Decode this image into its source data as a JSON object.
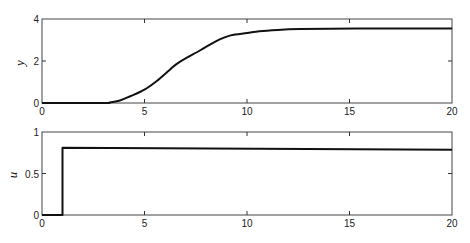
{
  "chart_data": [
    {
      "type": "line",
      "title": "",
      "xlabel": "",
      "ylabel": "y",
      "xlim": [
        0,
        20
      ],
      "ylim": [
        0,
        4
      ],
      "xticks": [
        0,
        5,
        10,
        15,
        20
      ],
      "yticks": [
        0,
        2,
        4
      ],
      "grid": false,
      "legend": null,
      "series": [
        {
          "name": "y",
          "x": [
            0,
            3.0,
            3.3,
            3.8,
            4.3,
            5.0,
            5.6,
            6.25,
            6.7,
            7.7,
            8.5,
            9.2,
            10.0,
            10.6,
            11.5,
            12.6,
            14,
            16,
            18,
            20
          ],
          "y": [
            0,
            0,
            0.02,
            0.12,
            0.32,
            0.64,
            1.05,
            1.6,
            1.95,
            2.5,
            2.95,
            3.22,
            3.33,
            3.42,
            3.48,
            3.52,
            3.54,
            3.55,
            3.55,
            3.55
          ]
        }
      ]
    },
    {
      "type": "line",
      "title": "",
      "xlabel": "",
      "ylabel": "u",
      "xlim": [
        0,
        20
      ],
      "ylim": [
        0,
        1
      ],
      "xticks": [
        0,
        5,
        10,
        15,
        20
      ],
      "yticks": [
        0,
        0.5,
        1
      ],
      "grid": false,
      "legend": null,
      "series": [
        {
          "name": "u",
          "x": [
            0,
            1,
            1,
            20
          ],
          "y": [
            0,
            0,
            0.81,
            0.785
          ]
        }
      ]
    }
  ],
  "labels": {
    "top_ylabel": "y",
    "bottom_ylabel": "u",
    "top_xticks": [
      "0",
      "5",
      "10",
      "15",
      "20"
    ],
    "top_yticks": [
      "0",
      "2",
      "4"
    ],
    "bottom_xticks": [
      "0",
      "5",
      "10",
      "15",
      "20"
    ],
    "bottom_yticks": [
      "0",
      "0.5",
      "1"
    ]
  }
}
